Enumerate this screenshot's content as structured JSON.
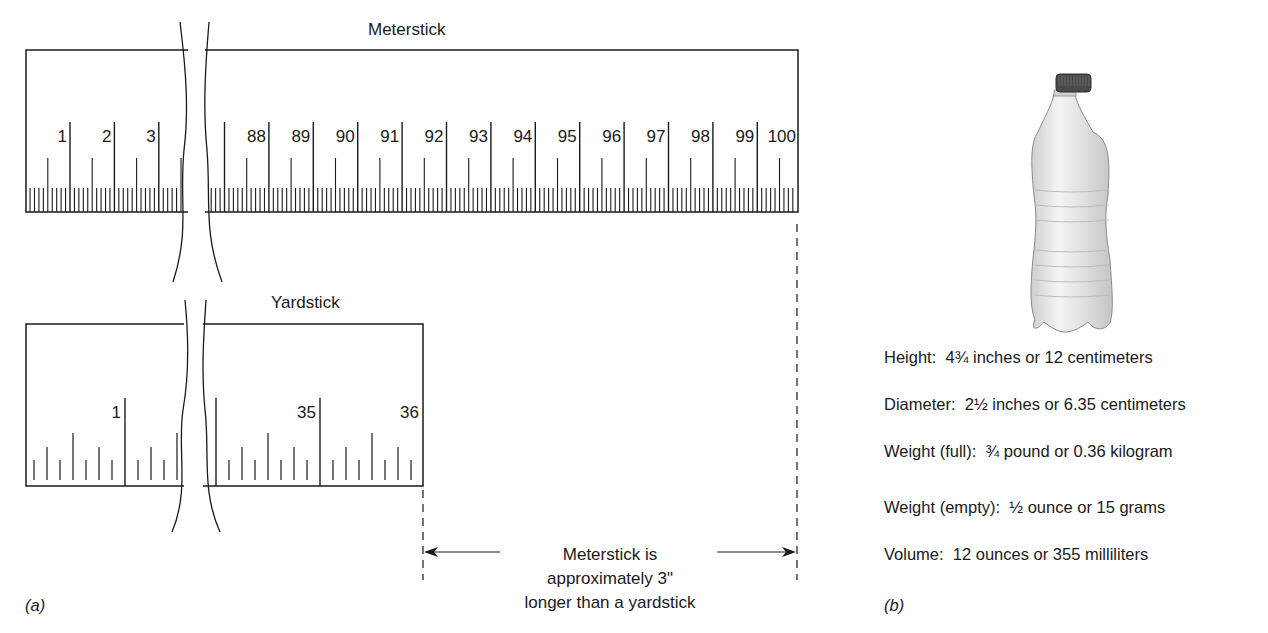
{
  "panel_a": {
    "caption": "(a)",
    "meterstick": {
      "title": "Meterstick",
      "labels_left": [
        "1",
        "2",
        "3"
      ],
      "labels_right": [
        "88",
        "89",
        "90",
        "91",
        "92",
        "93",
        "94",
        "95",
        "96",
        "97",
        "98",
        "99",
        "100"
      ],
      "unit": "centimeter",
      "subdivision": "millimeter"
    },
    "yardstick": {
      "title": "Yardstick",
      "labels_left": [
        "1"
      ],
      "labels_right": [
        "35",
        "36"
      ],
      "unit": "inch",
      "subdivision": "1/8 inch"
    },
    "comparison_note": {
      "line1": "Meterstick is",
      "line2": "approximately 3\"",
      "line3": "longer than a yardstick"
    }
  },
  "panel_b": {
    "caption": "(b)",
    "image": "water-bottle",
    "specs": [
      {
        "label": "Height:",
        "value": "4¾  inches or 12 centimeters"
      },
      {
        "label": "Diameter:",
        "value": "2½  inches or 6.35 centimeters"
      },
      {
        "label": "Weight (full):",
        "value": "¾ pound or 0.36 kilogram"
      },
      {
        "label": "Weight (empty):",
        "value": "½ ounce or 15 grams"
      },
      {
        "label": "Volume:",
        "value": "12 ounces or 355 milliliters"
      }
    ]
  },
  "colors": {
    "line": "#1a1a1a",
    "background": "#ffffff",
    "bottle_cap": "#4a4a4a",
    "bottle_body": "#e6e6e6"
  }
}
